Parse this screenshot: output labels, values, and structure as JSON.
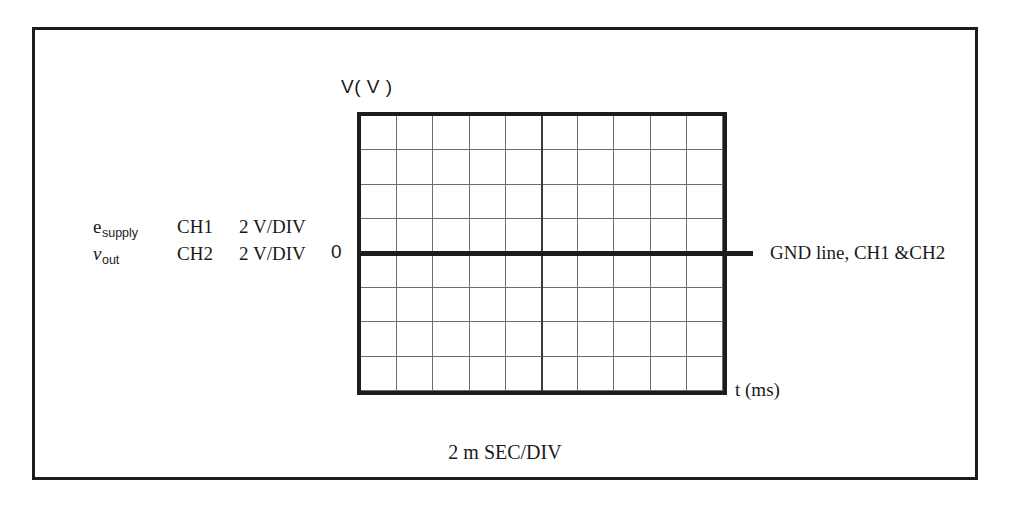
{
  "figure": {
    "type": "oscilloscope-display",
    "vertical_axis_label": "V( V )",
    "horizontal_axis_label": "t (ms)",
    "zero_marker": "0",
    "ground_annotation": "GND line, CH1 &CH2",
    "timebase_caption": "2 m SEC/DIV"
  },
  "legend": {
    "rows": [
      {
        "signal_base": "e",
        "signal_subscript": "supply",
        "signal_italic": false,
        "channel": "CH1",
        "scale": "2  V/DIV"
      },
      {
        "signal_base": "v",
        "signal_subscript": "out",
        "signal_italic": true,
        "channel": "CH2",
        "scale": "2  V/DIV"
      }
    ]
  },
  "chart_data": {
    "type": "line",
    "title": "",
    "xlabel": "t (ms)",
    "ylabel": "V( V )",
    "grid": true,
    "legend_position": "left-outside",
    "x_divisions": 10,
    "y_divisions": 8,
    "x_per_division": "2 m SEC/DIV",
    "y_per_division": "2 V/DIV",
    "zero_line_division_from_top": 4,
    "center_vertical_division": 5,
    "series": [
      {
        "name": "e_supply",
        "channel": "CH1",
        "volts_per_div": 2,
        "values": []
      },
      {
        "name": "v_out",
        "channel": "CH2",
        "volts_per_div": 2,
        "values": []
      }
    ],
    "annotations": [
      {
        "text": "GND line, CH1 &CH2",
        "target": "zero-volt-line",
        "position": "right"
      },
      {
        "text": "0",
        "target": "zero-volt-line",
        "position": "left"
      },
      {
        "text": "2 m SEC/DIV",
        "position": "below-plot"
      }
    ]
  },
  "colors": {
    "frame": "#1c1c1c",
    "screen_border": "#1c1c1c",
    "gridline": "#6e6e6e",
    "center_line": "#3a3a3a",
    "ground_line": "#1c1c1c",
    "background": "#ffffff",
    "text": "#1a1a1a"
  }
}
